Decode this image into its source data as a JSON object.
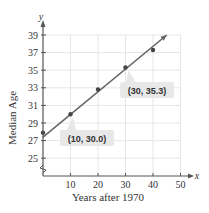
{
  "chart_data": {
    "type": "scatter",
    "title": "",
    "xlabel": "Years after 1970",
    "ylabel": "Median Age",
    "x_axis_var": "x",
    "y_axis_var": "y",
    "xlim": [
      0,
      50
    ],
    "ylim": [
      25,
      39
    ],
    "y_axis_break": true,
    "x_ticks": [
      10,
      20,
      30,
      40,
      50
    ],
    "y_ticks": [
      25,
      27,
      29,
      31,
      33,
      35,
      37,
      39
    ],
    "grid": true,
    "series": [
      {
        "name": "Median age data",
        "type": "scatter",
        "x": [
          0,
          10,
          20,
          30,
          40
        ],
        "y": [
          27.9,
          30.0,
          32.8,
          35.3,
          37.3
        ]
      },
      {
        "name": "Line of best fit",
        "type": "line",
        "x": [
          0,
          45
        ],
        "y": [
          27.4,
          39.0
        ],
        "through_points": [
          [
            10,
            30.0
          ],
          [
            30,
            35.3
          ]
        ]
      }
    ],
    "annotations": [
      {
        "text": "(10, 30.0)",
        "x": 10,
        "y": 30.0
      },
      {
        "text": "(30, 35.3)",
        "x": 30,
        "y": 35.3
      }
    ]
  },
  "colors": {
    "axis": "#555555",
    "grid": "#e6e6e6",
    "line": "#666666",
    "point": "#444444",
    "callout_bg": "#e8e8e8"
  }
}
